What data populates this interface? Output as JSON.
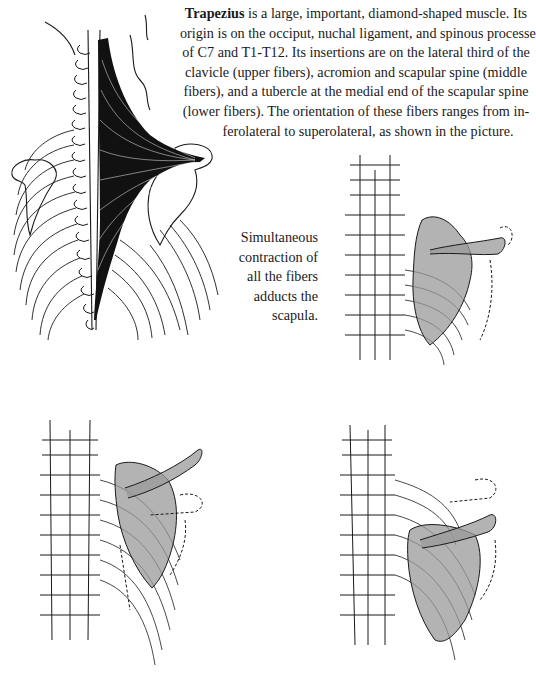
{
  "description": {
    "term": "Trapezius",
    "lines": [
      " is a large, important, diamond-shaped muscle. Its",
      "origin is on the occiput, nuchal ligament, and spinous processes",
      "of C7 and T1-T12. Its insertions are on the lateral third of the",
      "clavicle (upper fibers), acromion and scapular spine (middle",
      "fibers), and a tubercle at the medial end of the scapular spine",
      "(lower fibers). The orientation of these fibers ranges from in-",
      "ferolateral to superolateral, as shown in the picture."
    ]
  },
  "caption": {
    "lines": [
      "Simultaneous",
      "contraction of",
      "all the fibers",
      "adducts the",
      "scapula."
    ]
  },
  "figures": [
    {
      "name": "trapezius-back-view",
      "label": "Posterior view of trapezius muscle fibers"
    },
    {
      "name": "scapula-adduction",
      "label": "Scapula adducted by simultaneous contraction"
    },
    {
      "name": "scapula-elevation",
      "label": "Scapula with upward shift"
    },
    {
      "name": "scapula-depression",
      "label": "Scapula with downward shift"
    }
  ],
  "colors": {
    "ink": "#1a1a1a",
    "stipple": "#8a8a8a",
    "paper": "#ffffff"
  }
}
